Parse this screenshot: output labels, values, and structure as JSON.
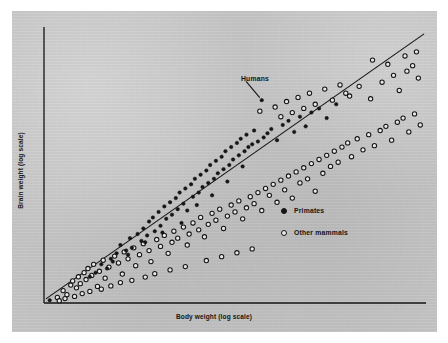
{
  "figure": {
    "background_color": "#ffffff",
    "panel_color": "#c6c6c6",
    "ink_color": "#141414"
  },
  "annotations": {
    "humans_label": "Humans"
  },
  "legend": {
    "items": [
      {
        "label": "Primates",
        "marker": "filled-circle"
      },
      {
        "label": "Other mammals",
        "marker": "open-circle"
      }
    ]
  },
  "chart_data": {
    "type": "scatter",
    "title": "",
    "xlabel": "Body weight (log scale)",
    "ylabel": "Brain weight (log scale)",
    "xlim": [
      0,
      100
    ],
    "ylim": [
      0,
      100
    ],
    "grid": false,
    "axes": {
      "style": "two-spine",
      "ticks": false,
      "tick_labels": false
    },
    "legend_position": "center-right",
    "annotations": [
      {
        "text": "Humans",
        "point": [
          57.0,
          73.5
        ],
        "text_position": [
          49.5,
          82.5
        ],
        "leader_line": true
      }
    ],
    "trend_line": {
      "label": "regression line",
      "from": [
        0.5,
        1.5
      ],
      "to": [
        99.5,
        97.5
      ]
    },
    "series": [
      {
        "name": "Primates",
        "marker": "filled-circle",
        "points": [
          [
            1.5,
            1.0
          ],
          [
            13.5,
            11.0
          ],
          [
            15.0,
            14.0
          ],
          [
            16.5,
            12.5
          ],
          [
            17.5,
            16.0
          ],
          [
            19.0,
            18.0
          ],
          [
            20.0,
            21.0
          ],
          [
            21.5,
            19.0
          ],
          [
            22.5,
            23.5
          ],
          [
            23.0,
            20.0
          ],
          [
            24.5,
            25.0
          ],
          [
            25.5,
            22.5
          ],
          [
            26.0,
            27.0
          ],
          [
            27.0,
            24.5
          ],
          [
            27.5,
            29.5
          ],
          [
            28.5,
            31.0
          ],
          [
            29.0,
            26.0
          ],
          [
            30.0,
            33.0
          ],
          [
            30.5,
            28.0
          ],
          [
            31.5,
            35.0
          ],
          [
            32.0,
            30.5
          ],
          [
            33.0,
            36.5
          ],
          [
            33.5,
            32.0
          ],
          [
            34.5,
            38.0
          ],
          [
            35.0,
            34.0
          ],
          [
            35.5,
            40.0
          ],
          [
            36.5,
            36.0
          ],
          [
            37.0,
            41.5
          ],
          [
            37.5,
            33.5
          ],
          [
            38.5,
            43.0
          ],
          [
            39.0,
            38.5
          ],
          [
            39.5,
            45.0
          ],
          [
            40.5,
            40.0
          ],
          [
            41.0,
            46.5
          ],
          [
            41.5,
            42.0
          ],
          [
            42.5,
            48.0
          ],
          [
            43.0,
            43.5
          ],
          [
            43.5,
            50.0
          ],
          [
            44.5,
            45.0
          ],
          [
            45.0,
            51.5
          ],
          [
            45.5,
            47.0
          ],
          [
            46.5,
            53.0
          ],
          [
            47.0,
            48.5
          ],
          [
            47.5,
            55.0
          ],
          [
            48.5,
            50.0
          ],
          [
            49.0,
            56.5
          ],
          [
            49.5,
            52.0
          ],
          [
            50.5,
            58.0
          ],
          [
            51.0,
            53.5
          ],
          [
            51.5,
            59.5
          ],
          [
            52.5,
            55.0
          ],
          [
            53.0,
            61.0
          ],
          [
            53.5,
            56.5
          ],
          [
            54.5,
            57.5
          ],
          [
            55.0,
            62.5
          ],
          [
            56.0,
            58.5
          ],
          [
            57.0,
            73.5
          ],
          [
            57.5,
            60.0
          ],
          [
            58.5,
            61.5
          ],
          [
            59.5,
            63.0
          ],
          [
            61.0,
            59.0
          ],
          [
            62.5,
            64.5
          ],
          [
            64.0,
            66.0
          ],
          [
            65.5,
            62.0
          ],
          [
            67.0,
            67.5
          ],
          [
            68.5,
            64.0
          ],
          [
            70.0,
            69.0
          ],
          [
            72.0,
            70.5
          ],
          [
            74.0,
            67.0
          ],
          [
            76.5,
            72.0
          ],
          [
            12.0,
            9.5
          ],
          [
            18.0,
            15.0
          ],
          [
            22.0,
            17.5
          ],
          [
            26.5,
            22.0
          ],
          [
            31.0,
            25.5
          ],
          [
            36.0,
            29.0
          ],
          [
            40.0,
            35.5
          ],
          [
            44.0,
            39.0
          ],
          [
            48.0,
            44.0
          ],
          [
            52.0,
            49.5
          ]
        ]
      },
      {
        "name": "Other mammals",
        "marker": "open-circle",
        "points": [
          [
            3.5,
            2.0
          ],
          [
            5.0,
            4.5
          ],
          [
            6.0,
            3.0
          ],
          [
            7.0,
            6.5
          ],
          [
            7.5,
            8.0
          ],
          [
            8.5,
            5.5
          ],
          [
            9.0,
            9.5
          ],
          [
            9.5,
            7.0
          ],
          [
            10.5,
            11.0
          ],
          [
            11.0,
            8.5
          ],
          [
            11.5,
            12.5
          ],
          [
            12.5,
            10.0
          ],
          [
            13.0,
            14.0
          ],
          [
            14.0,
            6.0
          ],
          [
            14.5,
            11.5
          ],
          [
            15.5,
            15.5
          ],
          [
            16.0,
            9.0
          ],
          [
            17.0,
            13.0
          ],
          [
            18.5,
            17.0
          ],
          [
            19.5,
            14.5
          ],
          [
            20.5,
            10.5
          ],
          [
            21.0,
            18.5
          ],
          [
            22.0,
            16.0
          ],
          [
            23.5,
            20.0
          ],
          [
            24.0,
            13.5
          ],
          [
            25.0,
            17.5
          ],
          [
            26.0,
            21.5
          ],
          [
            27.5,
            19.0
          ],
          [
            28.0,
            15.0
          ],
          [
            29.5,
            23.0
          ],
          [
            30.5,
            20.5
          ],
          [
            31.5,
            24.5
          ],
          [
            32.5,
            18.0
          ],
          [
            33.5,
            22.0
          ],
          [
            34.0,
            26.0
          ],
          [
            35.0,
            23.5
          ],
          [
            36.5,
            27.5
          ],
          [
            37.5,
            21.0
          ],
          [
            38.0,
            25.0
          ],
          [
            39.0,
            29.0
          ],
          [
            40.5,
            26.5
          ],
          [
            41.0,
            31.0
          ],
          [
            42.0,
            24.0
          ],
          [
            43.0,
            28.5
          ],
          [
            44.0,
            32.5
          ],
          [
            45.0,
            30.0
          ],
          [
            46.0,
            34.0
          ],
          [
            47.0,
            27.0
          ],
          [
            48.0,
            31.5
          ],
          [
            49.0,
            35.5
          ],
          [
            50.0,
            33.0
          ],
          [
            51.0,
            37.0
          ],
          [
            52.0,
            30.5
          ],
          [
            53.0,
            34.5
          ],
          [
            54.0,
            38.5
          ],
          [
            55.0,
            36.0
          ],
          [
            56.0,
            40.0
          ],
          [
            56.5,
            69.5
          ],
          [
            57.0,
            33.5
          ],
          [
            58.0,
            41.5
          ],
          [
            59.0,
            39.0
          ],
          [
            60.0,
            43.0
          ],
          [
            61.0,
            36.5
          ],
          [
            62.0,
            44.5
          ],
          [
            63.0,
            41.0
          ],
          [
            64.0,
            46.0
          ],
          [
            65.0,
            38.0
          ],
          [
            66.0,
            47.5
          ],
          [
            67.0,
            43.5
          ],
          [
            68.0,
            49.0
          ],
          [
            69.0,
            45.0
          ],
          [
            70.0,
            50.5
          ],
          [
            71.0,
            40.5
          ],
          [
            72.0,
            52.0
          ],
          [
            73.0,
            47.0
          ],
          [
            74.0,
            53.5
          ],
          [
            75.0,
            49.5
          ],
          [
            76.0,
            55.0
          ],
          [
            77.0,
            51.0
          ],
          [
            78.0,
            56.5
          ],
          [
            79.5,
            58.0
          ],
          [
            80.5,
            53.0
          ],
          [
            82.0,
            59.5
          ],
          [
            83.5,
            55.5
          ],
          [
            85.0,
            61.0
          ],
          [
            86.5,
            57.0
          ],
          [
            88.0,
            62.5
          ],
          [
            89.5,
            64.0
          ],
          [
            91.0,
            59.0
          ],
          [
            92.5,
            65.5
          ],
          [
            94.0,
            67.0
          ],
          [
            95.5,
            62.0
          ],
          [
            97.0,
            68.5
          ],
          [
            98.5,
            64.5
          ],
          [
            79.0,
            76.0
          ],
          [
            82.5,
            78.5
          ],
          [
            85.5,
            74.0
          ],
          [
            88.5,
            80.0
          ],
          [
            91.5,
            82.5
          ],
          [
            93.0,
            77.0
          ],
          [
            95.0,
            84.0
          ],
          [
            96.5,
            86.0
          ],
          [
            98.0,
            81.5
          ],
          [
            86.0,
            88.0
          ],
          [
            90.0,
            86.5
          ],
          [
            94.5,
            89.5
          ],
          [
            97.5,
            91.0
          ],
          [
            60.5,
            71.0
          ],
          [
            62.0,
            67.5
          ],
          [
            63.5,
            73.0
          ],
          [
            65.0,
            69.0
          ],
          [
            66.5,
            74.5
          ],
          [
            68.0,
            70.5
          ],
          [
            69.5,
            76.0
          ],
          [
            71.0,
            72.0
          ],
          [
            73.5,
            77.5
          ],
          [
            75.5,
            73.5
          ],
          [
            77.5,
            79.0
          ],
          [
            80.0,
            75.0
          ],
          [
            4.0,
            0.8
          ],
          [
            5.5,
            1.6
          ],
          [
            8.0,
            2.4
          ],
          [
            10.0,
            3.4
          ],
          [
            12.0,
            4.2
          ],
          [
            15.0,
            5.0
          ],
          [
            17.5,
            6.2
          ],
          [
            20.0,
            7.4
          ],
          [
            23.0,
            8.2
          ],
          [
            26.5,
            9.4
          ],
          [
            29.0,
            10.6
          ],
          [
            33.0,
            12.0
          ],
          [
            37.0,
            13.2
          ],
          [
            42.5,
            15.4
          ],
          [
            46.5,
            16.8
          ],
          [
            50.5,
            18.2
          ],
          [
            54.5,
            19.6
          ]
        ]
      }
    ]
  }
}
